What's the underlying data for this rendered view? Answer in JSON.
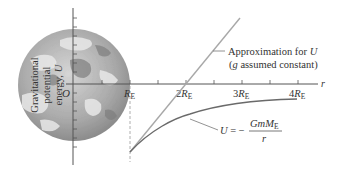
{
  "figure": {
    "yaxis_label_lines": [
      "Gravitational",
      "potential",
      "energy,"
    ],
    "yaxis_symbol": "U",
    "origin_label": "O",
    "xaxis_symbol": "r",
    "ticks": [
      {
        "coef": "",
        "sub": "E",
        "sym": "R"
      },
      {
        "coef": "2",
        "sub": "E",
        "sym": "R"
      },
      {
        "coef": "3",
        "sub": "E",
        "sym": "R"
      },
      {
        "coef": "4",
        "sub": "E",
        "sym": "R"
      }
    ],
    "approx_label_line1_text": "Approximation for ",
    "approx_label_line1_sym": "U",
    "approx_label_line2_g": "g",
    "approx_label_line2_rest": " assumed constant)",
    "approx_label_line2_open": "(",
    "formula_lhs": "U",
    "formula_eq": " = −",
    "formula_num": "GmM",
    "formula_num_sub": "E",
    "formula_den": "r"
  },
  "colors": {
    "axis": "#555555",
    "approx_line": "#a8a8a8",
    "curve": "#6a6a6a",
    "earth_light": "#c8c8c8",
    "earth_dark": "#8a8a8a"
  }
}
